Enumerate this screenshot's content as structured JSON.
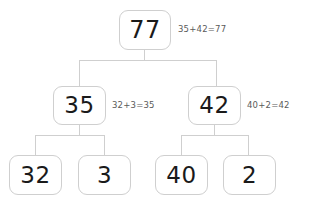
{
  "chart_data": {
    "type": "diagram",
    "title": "",
    "diagram_kind": "number-bond-decomposition-tree",
    "orientation": "top-down",
    "levels": 3,
    "root": {
      "value": "77",
      "annotation": "35+42=77",
      "children": [
        {
          "value": "35",
          "annotation": "32+3=35",
          "children": [
            {
              "value": "32",
              "annotation": ""
            },
            {
              "value": "3",
              "annotation": ""
            }
          ]
        },
        {
          "value": "42",
          "annotation": "40+2=42",
          "children": [
            {
              "value": "40",
              "annotation": ""
            },
            {
              "value": "2",
              "annotation": ""
            }
          ]
        }
      ]
    },
    "nodes": [
      {
        "id": "root",
        "label": "77",
        "level": 0
      },
      {
        "id": "mid-left",
        "label": "35",
        "level": 1
      },
      {
        "id": "mid-right",
        "label": "42",
        "level": 1
      },
      {
        "id": "leaf-1",
        "label": "32",
        "level": 2
      },
      {
        "id": "leaf-2",
        "label": "3",
        "level": 2
      },
      {
        "id": "leaf-3",
        "label": "40",
        "level": 2
      },
      {
        "id": "leaf-4",
        "label": "2",
        "level": 2
      }
    ],
    "edges": [
      {
        "from": "root",
        "to": "mid-left"
      },
      {
        "from": "root",
        "to": "mid-right"
      },
      {
        "from": "mid-left",
        "to": "leaf-1"
      },
      {
        "from": "mid-left",
        "to": "leaf-2"
      },
      {
        "from": "mid-right",
        "to": "leaf-3"
      },
      {
        "from": "mid-right",
        "to": "leaf-4"
      }
    ],
    "annotations": [
      "35+42=77",
      "32+3=35",
      "40+2=42"
    ],
    "colors": {
      "background": "#ffffff",
      "box_border": "#cfcfcf",
      "connector": "#cfcfcf",
      "value_text": "#1a1a1a",
      "annotation_text": "#5a5a5a"
    }
  },
  "nodes": {
    "root": {
      "value": "77",
      "annotation": "35+42=77"
    },
    "mid_left": {
      "value": "35",
      "annotation": "32+3=35"
    },
    "mid_right": {
      "value": "42",
      "annotation": "40+2=42"
    },
    "leaf_1": {
      "value": "32"
    },
    "leaf_2": {
      "value": "3"
    },
    "leaf_3": {
      "value": "40"
    },
    "leaf_4": {
      "value": "2"
    }
  }
}
